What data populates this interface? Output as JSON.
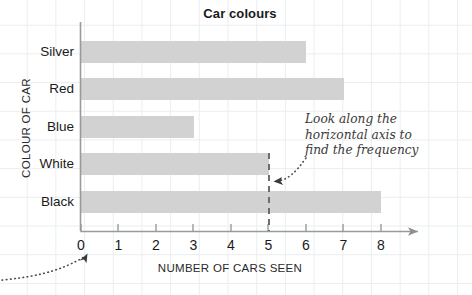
{
  "chart_data": {
    "type": "bar",
    "orientation": "horizontal",
    "title": "Car colours",
    "xlabel": "NUMBER OF CARS SEEN",
    "ylabel": "COLOUR OF CAR",
    "categories": [
      "Silver",
      "Red",
      "Blue",
      "White",
      "Black"
    ],
    "values": [
      6,
      7,
      3,
      5,
      8
    ],
    "xlim": [
      0,
      8
    ],
    "xticks": [
      "0",
      "1",
      "2",
      "3",
      "4",
      "5",
      "6",
      "7",
      "8"
    ],
    "grid": true,
    "legend": "none",
    "bar_color": "#d2d2d2",
    "annotations": [
      {
        "name": "frequency-note",
        "lines": [
          "Look along the",
          "horizontal axis to",
          "find the frequency"
        ],
        "points_to": 5
      },
      {
        "name": "origin-pointer",
        "lines": [],
        "points_to": 0
      }
    ],
    "guide_line": {
      "value": 5,
      "style": "dashed",
      "category": "White"
    }
  },
  "colors": {
    "bar": "#d2d2d2",
    "axis": "#8f8f8f",
    "grid": "#e9eef1",
    "text": "#1a1a1a",
    "annotation": "#3a3a3a"
  }
}
